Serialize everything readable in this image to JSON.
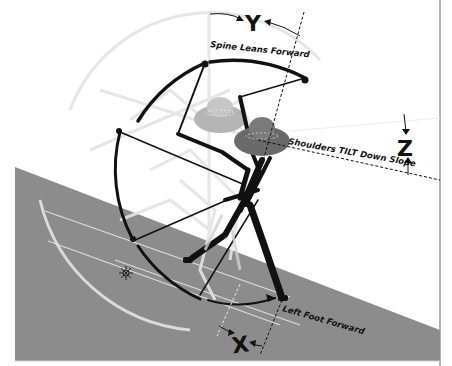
{
  "diagram": {
    "labels": {
      "y_letter": "Y",
      "spine": "Spine Leans Forward",
      "z_letter": "Z",
      "shoulders": "Shoulders TILT Down Slope",
      "x_letter": "X",
      "foot": "Left Foot Forward"
    },
    "colors": {
      "background": "#ffffff",
      "slope": "#8c8c8c",
      "slope_line": "#d9d9d9",
      "ink": "#111111",
      "ghost": "#e2e2e2",
      "ghost_hat": "#b5b5b5",
      "hat": "#6a6a6a",
      "frame": "#9a9a9a"
    }
  }
}
